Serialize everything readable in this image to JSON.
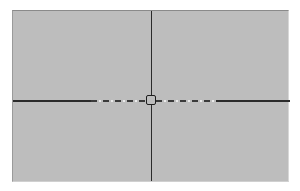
{
  "canvas": {
    "background_color": "#bdbdbd",
    "border_color": "#8a8a8a"
  },
  "crosshair": {
    "line_color": "#2b2b2b",
    "dash_highlight_color": "#eaeaea",
    "vertical_x": 150,
    "horizontal_y": 100,
    "dashed_range": {
      "start_x": 90,
      "end_x": 215
    },
    "center_handle": {
      "x": 150,
      "y": 100,
      "size": 10
    }
  }
}
